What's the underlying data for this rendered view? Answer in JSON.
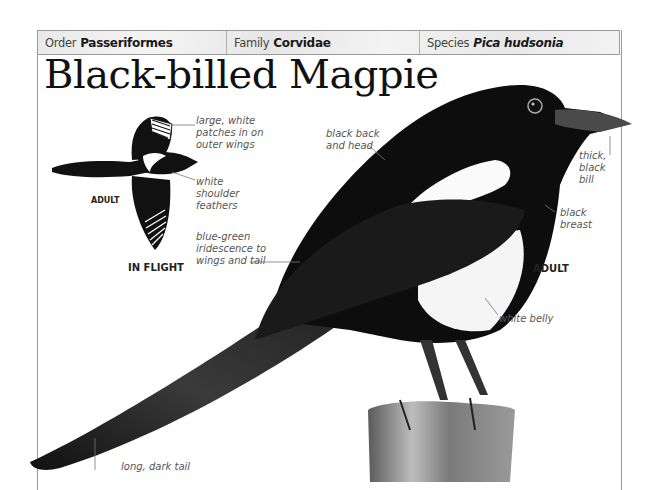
{
  "taxonomy": {
    "order": {
      "label": "Order",
      "value": "Passeriformes"
    },
    "family": {
      "label": "Family",
      "value": "Corvidae"
    },
    "species": {
      "label": "Species",
      "value": "Pica hudsonia"
    }
  },
  "title": "Black-billed Magpie",
  "inflight": {
    "caption": "IN FLIGHT",
    "age_tag": "ADULT",
    "annotations": {
      "wing_patches": [
        "large, white",
        "patches in on",
        "outer wings"
      ],
      "shoulder": [
        "white",
        "shoulder",
        "feathers"
      ],
      "iridescence": [
        "blue-green",
        "iridescence to",
        "wings and tail"
      ]
    }
  },
  "perched": {
    "age_tag": "ADULT",
    "annotations": {
      "back_head": [
        "black back",
        "and head"
      ],
      "bill": [
        "thick,",
        "black",
        "bill"
      ],
      "breast": [
        "black",
        "breast"
      ],
      "belly": [
        "white belly"
      ],
      "tail": [
        "long, dark tail"
      ]
    }
  },
  "colors": {
    "frame": "#9a9a9a",
    "text": "#111111",
    "annotation": "#555555",
    "bird": "#0d0d0d"
  }
}
